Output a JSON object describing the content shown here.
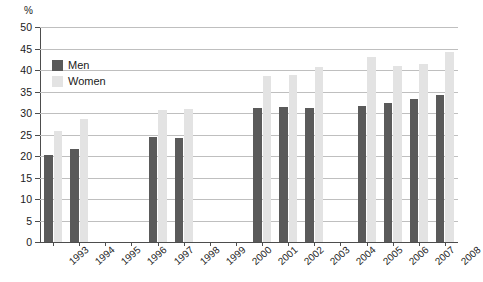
{
  "chart_data": {
    "type": "bar",
    "title": "",
    "xlabel": "",
    "ylabel": "%",
    "ylim": [
      0,
      50
    ],
    "ytick_step": 5,
    "yticks": [
      50,
      45,
      40,
      35,
      30,
      25,
      20,
      15,
      10,
      5,
      0
    ],
    "grid": true,
    "legend_position": "top-left",
    "categories": [
      "1993",
      "1994",
      "1995",
      "1996",
      "1997",
      "1998",
      "1999",
      "2000",
      "2001",
      "2002",
      "2003",
      "2004",
      "2005",
      "2006",
      "2007",
      "2008"
    ],
    "series": [
      {
        "name": "Men",
        "color": "#5a5a5a",
        "values": [
          20.2,
          21.7,
          null,
          null,
          24.4,
          24.2,
          null,
          null,
          31.1,
          31.5,
          31.1,
          null,
          31.6,
          32.4,
          33.3,
          34.1
        ]
      },
      {
        "name": "Women",
        "color": "#e3e3e3",
        "values": [
          25.9,
          28.5,
          null,
          null,
          30.6,
          30.9,
          null,
          null,
          38.5,
          38.9,
          40.6,
          null,
          43.1,
          41.0,
          41.4,
          44.2
        ]
      }
    ]
  },
  "legend": {
    "items": [
      {
        "label": "Men",
        "swatch": "men"
      },
      {
        "label": "Women",
        "swatch": "women"
      }
    ]
  },
  "axis": {
    "unit": "%"
  }
}
